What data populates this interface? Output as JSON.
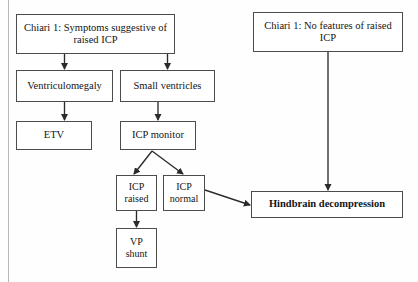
{
  "figure": {
    "caption_partial": ""
  },
  "nodes": {
    "symptoms_raised_icp": "Chiari 1: Symptoms suggestive of raised ICP",
    "no_features_raised_icp": "Chiari 1: No features of raised ICP",
    "ventriculomegaly": "Ventriculomegaly",
    "small_ventricles": "Small ventricles",
    "etv": "ETV",
    "icp_monitor": "ICP monitor",
    "icp_raised": "ICP raised",
    "icp_normal": "ICP normal",
    "vp_shunt": "VP shunt",
    "hindbrain_decompression": "Hindbrain decompression"
  },
  "edges": [
    {
      "from": "symptoms_raised_icp",
      "to": "ventriculomegaly",
      "style": "solid-vertical"
    },
    {
      "from": "symptoms_raised_icp",
      "to": "small_ventricles",
      "style": "solid-vertical"
    },
    {
      "from": "ventriculomegaly",
      "to": "etv",
      "style": "solid-vertical"
    },
    {
      "from": "small_ventricles",
      "to": "icp_monitor",
      "style": "solid-vertical"
    },
    {
      "from": "icp_monitor",
      "to": "icp_raised",
      "style": "solid-diagonal"
    },
    {
      "from": "icp_monitor",
      "to": "icp_normal",
      "style": "solid-diagonal"
    },
    {
      "from": "icp_raised",
      "to": "vp_shunt",
      "style": "solid-vertical"
    },
    {
      "from": "icp_normal",
      "to": "hindbrain_decompression",
      "style": "solid-diagonal"
    },
    {
      "from": "no_features_raised_icp",
      "to": "hindbrain_decompression",
      "style": "solid-vertical-long"
    }
  ],
  "colors": {
    "box_border": "#4c4c4c",
    "arrow": "#2b2b2b",
    "text": "#141414",
    "page_rule": "#b9b9b9",
    "background": "#fefefe"
  }
}
